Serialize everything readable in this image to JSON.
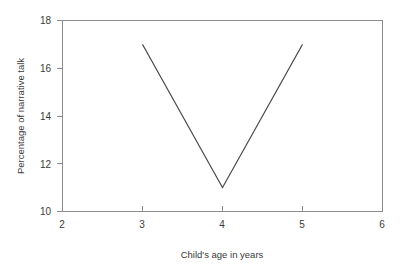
{
  "chart_data": {
    "type": "line",
    "title": "",
    "xlabel": "Child's age in years",
    "ylabel": "Percentage of narrative talk",
    "x": [
      3,
      4,
      5
    ],
    "values": [
      17.0,
      11.0,
      17.0
    ],
    "series": [
      {
        "name": "Percentage of narrative talk",
        "x": [
          3,
          4,
          5
        ],
        "values": [
          17.0,
          11.0,
          17.0
        ]
      }
    ],
    "xlim": [
      2,
      6
    ],
    "ylim": [
      10,
      18
    ],
    "xticks": [
      2,
      3,
      4,
      5,
      6
    ],
    "yticks": [
      10,
      12,
      14,
      16,
      18
    ],
    "xtick_labels": [
      "2",
      "3",
      "4",
      "5",
      "6"
    ],
    "ytick_labels": [
      "10",
      "12",
      "14",
      "16",
      "18"
    ],
    "grid": false,
    "legend": false,
    "legend_position": "none",
    "line_color": "#4a4a4a",
    "frame_color": "#8c8c8c",
    "background_color": "#ffffff",
    "markers": false,
    "annotations": []
  }
}
